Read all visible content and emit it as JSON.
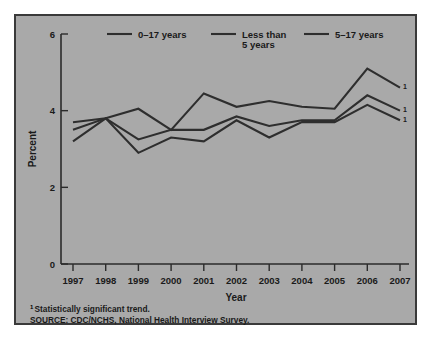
{
  "chart_data": {
    "type": "line",
    "title": "",
    "xlabel": "Year",
    "ylabel": "Percent",
    "x": [
      1997,
      1998,
      1999,
      2000,
      2001,
      2002,
      2003,
      2004,
      2005,
      2006,
      2007
    ],
    "xtick_labels": [
      "1997",
      "1998",
      "1999",
      "2000",
      "2001",
      "2002",
      "2003",
      "2004",
      "2005",
      "2006",
      "2007"
    ],
    "ytick_labels": [
      "0",
      "2",
      "4",
      "6"
    ],
    "yticks": [
      0,
      2,
      4,
      6
    ],
    "ylim": [
      0,
      6
    ],
    "xlim": [
      1997,
      2007
    ],
    "grid": false,
    "legend_position": "top",
    "series": [
      {
        "name": "0–17 years",
        "values": [
          3.5,
          3.8,
          3.25,
          3.5,
          3.5,
          3.85,
          3.6,
          3.75,
          3.75,
          4.4,
          4.0
        ],
        "endpoint_marker": "1"
      },
      {
        "name": "Less than 5 years",
        "values": [
          3.7,
          3.8,
          4.05,
          3.5,
          4.45,
          4.1,
          4.25,
          4.1,
          4.05,
          5.1,
          4.6
        ],
        "endpoint_marker": "1"
      },
      {
        "name": "5–17 years",
        "values": [
          3.2,
          3.8,
          2.9,
          3.3,
          3.2,
          3.75,
          3.3,
          3.7,
          3.7,
          4.15,
          3.75
        ],
        "endpoint_marker": "1"
      }
    ]
  },
  "legend": {
    "items": [
      {
        "label_line1": "0–17 years",
        "label_line2": ""
      },
      {
        "label_line1": "Less than",
        "label_line2": "5 years"
      },
      {
        "label_line1": "5–17 years",
        "label_line2": ""
      }
    ]
  },
  "footnotes": {
    "marker": "1",
    "note": "Statistically significant trend.",
    "source": "SOURCE: CDC/NCHS, National Health Interview Survey."
  },
  "colors": {
    "panel_background": "#a9a9a9",
    "page_background": "#ffffff",
    "line": "#2e2e2e",
    "text": "#1a1a1a",
    "border": "#3a3a3a"
  }
}
